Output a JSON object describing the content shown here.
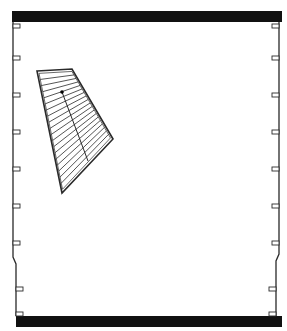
{
  "figure": {
    "width": 287,
    "height": 331,
    "stroke_color": "#2a2a2a",
    "fill_color": "#111111",
    "top_bar": {
      "x": 12,
      "y": 11,
      "w": 270,
      "h": 11
    },
    "bottom_bar": {
      "x": 16,
      "y": 316,
      "w": 266,
      "h": 11
    },
    "left_wall": [
      [
        13,
        22
      ],
      [
        13,
        257
      ],
      [
        16,
        264
      ],
      [
        16,
        316
      ]
    ],
    "right_wall": [
      [
        279,
        22
      ],
      [
        279,
        254
      ],
      [
        276,
        261
      ],
      [
        276,
        316
      ]
    ],
    "left_notches_y": [
      26,
      58,
      95,
      132,
      169,
      206,
      243,
      289,
      314
    ],
    "right_notches_y": [
      26,
      58,
      95,
      132,
      169,
      206,
      243,
      289,
      314
    ],
    "panel": {
      "outline": [
        [
          37,
          71
        ],
        [
          72,
          69
        ],
        [
          113,
          139
        ],
        [
          62,
          193
        ]
      ],
      "hatch_lines": 18,
      "axis_line": [
        [
          62,
          92
        ],
        [
          88,
          161
        ]
      ],
      "pivot_dot": [
        62,
        92
      ]
    }
  }
}
